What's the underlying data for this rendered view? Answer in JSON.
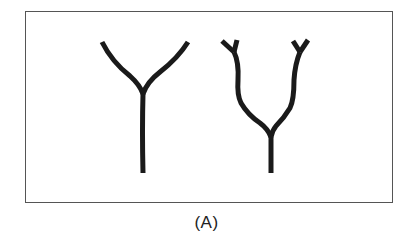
{
  "figure": {
    "caption": "(A)",
    "stroke_color": "#1a1a1a",
    "border_color": "#555555",
    "shapes": [
      {
        "name": "simple-y-branch",
        "description": "Single Y-shaped branching structure"
      },
      {
        "name": "double-y-branch",
        "description": "Y-shaped structure whose two arms each end in a smaller Y fork"
      }
    ]
  }
}
